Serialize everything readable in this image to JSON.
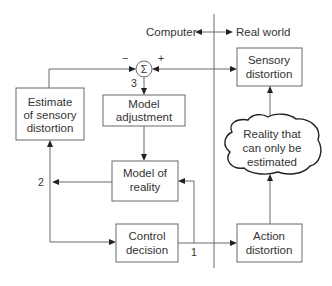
{
  "header": {
    "left_label": "Computer",
    "right_label": "Real world"
  },
  "summing_junction": {
    "symbol": "Σ",
    "minus_sign": "−",
    "plus_sign": "+"
  },
  "boxes": {
    "estimate_sensory_distortion": [
      "Estimate",
      "of sensory",
      "distortion"
    ],
    "model_adjustment": [
      "Model",
      "adjustment"
    ],
    "model_of_reality": [
      "Model of",
      "reality"
    ],
    "control_decision": [
      "Control",
      "decision"
    ],
    "sensory_distortion": [
      "Sensory",
      "distortion"
    ],
    "reality_cloud": [
      "Reality that",
      "can only be",
      "estimated"
    ],
    "action_distortion": [
      "Action",
      "distortion"
    ]
  },
  "path_labels": {
    "one": "1",
    "two": "2",
    "three": "3"
  },
  "colors": {
    "line": "#6a6a6a",
    "text": "#333333",
    "arrowhead": "#222222",
    "background": "#ffffff"
  }
}
